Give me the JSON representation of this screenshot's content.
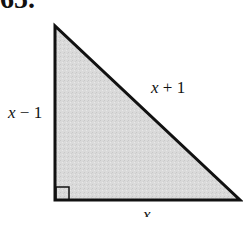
{
  "problem": {
    "number": "65."
  },
  "figure": {
    "type": "right-triangle",
    "fill_color": "#d9d9d9",
    "stroke_color": "#111111",
    "vertices": {
      "top": [
        54,
        25
      ],
      "right_angle": [
        55,
        200
      ],
      "right": [
        241,
        201
      ]
    },
    "right_angle_marker": true
  },
  "labels": {
    "left_leg": {
      "var": "x",
      "rest": " − 1"
    },
    "hypotenuse": {
      "var": "x",
      "rest": " + 1"
    },
    "base": {
      "var": "x",
      "rest": ""
    }
  }
}
